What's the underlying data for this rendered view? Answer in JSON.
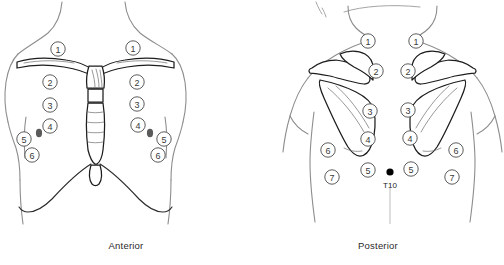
{
  "figure": {
    "width": 504,
    "height": 265
  },
  "colors": {
    "background": "#ffffff",
    "body_outline": "#8d8d8d",
    "bone_outline": "#1d1d1d",
    "marker_circle_stroke": "#4a4a4a",
    "number_text": "#3a3a3a",
    "nipple_marker": "#5a5a5a",
    "t10_marker": "#000000",
    "caption_text": "#2a2a2a"
  },
  "panels": [
    {
      "id": "anterior",
      "caption": "Anterior",
      "markers": [
        {
          "number": "1",
          "side": "left",
          "x": 58,
          "y": 49
        },
        {
          "number": "1",
          "side": "right",
          "x": 133,
          "y": 48
        },
        {
          "number": "2",
          "side": "left",
          "x": 50,
          "y": 82
        },
        {
          "number": "2",
          "side": "right",
          "x": 137,
          "y": 82
        },
        {
          "number": "3",
          "side": "left",
          "x": 50,
          "y": 105
        },
        {
          "number": "3",
          "side": "right",
          "x": 137,
          "y": 104
        },
        {
          "number": "4",
          "side": "left",
          "x": 50,
          "y": 126
        },
        {
          "number": "4",
          "side": "right",
          "x": 138,
          "y": 125
        },
        {
          "number": "5",
          "side": "left",
          "x": 24,
          "y": 139
        },
        {
          "number": "5",
          "side": "right",
          "x": 164,
          "y": 139
        },
        {
          "number": "6",
          "side": "left",
          "x": 32,
          "y": 155
        },
        {
          "number": "6",
          "side": "right",
          "x": 158,
          "y": 155
        }
      ],
      "dots": [
        {
          "name": "nipple-left",
          "x": 39,
          "y": 133,
          "rx": 3.1,
          "ry": 4.2,
          "color": "#5a5a5a"
        },
        {
          "name": "nipple-right",
          "x": 150,
          "y": 133,
          "rx": 3.1,
          "ry": 4.2,
          "color": "#5a5a5a"
        }
      ],
      "text_labels": []
    },
    {
      "id": "posterior",
      "caption": "Posterior",
      "markers": [
        {
          "number": "1",
          "side": "left",
          "x": 116,
          "y": 41
        },
        {
          "number": "1",
          "side": "right",
          "x": 164,
          "y": 41
        },
        {
          "number": "2",
          "side": "left",
          "x": 124,
          "y": 71
        },
        {
          "number": "2",
          "side": "right",
          "x": 156,
          "y": 71
        },
        {
          "number": "3",
          "side": "left",
          "x": 118,
          "y": 111
        },
        {
          "number": "3",
          "side": "right",
          "x": 156,
          "y": 110
        },
        {
          "number": "4",
          "side": "left",
          "x": 116,
          "y": 139
        },
        {
          "number": "4",
          "side": "right",
          "x": 158,
          "y": 138
        },
        {
          "number": "5",
          "side": "left",
          "x": 116,
          "y": 170
        },
        {
          "number": "5",
          "side": "right",
          "x": 159,
          "y": 169
        },
        {
          "number": "6",
          "side": "left",
          "x": 76,
          "y": 150
        },
        {
          "number": "6",
          "side": "right",
          "x": 204,
          "y": 150
        },
        {
          "number": "7",
          "side": "left",
          "x": 80,
          "y": 177
        },
        {
          "number": "7",
          "side": "right",
          "x": 200,
          "y": 177
        }
      ],
      "dots": [
        {
          "name": "t10-marker",
          "x": 138,
          "y": 172,
          "rx": 3.6,
          "ry": 3.6,
          "color": "#000000"
        }
      ],
      "text_labels": [
        {
          "name": "t10-label",
          "text": "T10",
          "x": 138,
          "y": 186
        }
      ]
    }
  ]
}
